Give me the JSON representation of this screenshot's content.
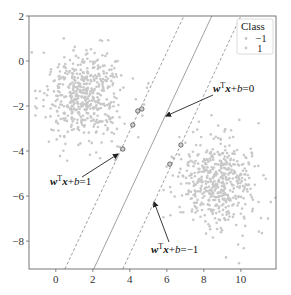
{
  "chart_data": {
    "type": "scatter",
    "title": "",
    "xlabel": "",
    "ylabel": "",
    "xlim": [
      -1.45,
      11.9
    ],
    "ylim": [
      -9.24,
      2
    ],
    "grid": false,
    "x_ticks": [
      0,
      2,
      4,
      6,
      8,
      10
    ],
    "x_tick_labels": [
      "0",
      "2",
      "4",
      "6",
      "8",
      "10"
    ],
    "y_ticks": [
      2,
      0,
      -2,
      -4,
      -6,
      -8
    ],
    "y_tick_labels": [
      "2",
      "0",
      "−2",
      "−4",
      "−6",
      "−8"
    ],
    "legend": {
      "title": "Class",
      "position": "upper right",
      "entries": [
        {
          "label": "−1",
          "color": "#c8c8c8"
        },
        {
          "label": "1",
          "color": "#c8c8c8"
        }
      ]
    },
    "series": [
      {
        "name": "−1",
        "color": "#c8c8c8",
        "center": [
          1.55,
          -1.55
        ],
        "std": [
          1.05,
          1.0
        ],
        "count": 500,
        "seed": 7
      },
      {
        "name": "1",
        "color": "#c8c8c8",
        "center": [
          8.8,
          -5.3
        ],
        "std": [
          1.0,
          1.05
        ],
        "count": 500,
        "seed": 13
      }
    ],
    "support_vectors": [
      [
        3.62,
        -3.91
      ],
      [
        4.16,
        -2.84
      ],
      [
        4.43,
        -2.22
      ],
      [
        4.65,
        -2.13
      ],
      [
        6.16,
        -4.58
      ],
      [
        6.76,
        -3.73
      ]
    ],
    "lines": [
      {
        "name": "w^T x + b = 1",
        "style": "dashed",
        "p1": [
          0.49,
          -9.24
        ],
        "p2": [
          6.92,
          2
        ]
      },
      {
        "name": "w^T x + b = 0",
        "style": "solid",
        "p1": [
          2.05,
          -9.24
        ],
        "p2": [
          8.43,
          2
        ]
      },
      {
        "name": "w^T x + b = -1",
        "style": "dashed",
        "p1": [
          3.62,
          -9.24
        ],
        "p2": [
          10.0,
          2
        ]
      }
    ],
    "annotations": [
      {
        "text_bold": "w",
        "sup": "T",
        "text_bold2": "x",
        "rest_pre": "+",
        "italic": "b",
        "rest": "=0",
        "text_xy": [
          213,
          92
        ],
        "arrow_from": [
          213,
          95
        ],
        "arrow_to": [
          166,
          116
        ]
      },
      {
        "text_bold": "w",
        "sup": "T",
        "text_bold2": "x",
        "rest_pre": "+",
        "italic": "b",
        "rest": "=1",
        "text_xy": [
          50,
          185
        ],
        "arrow_from": [
          82,
          177
        ],
        "arrow_to": [
          118,
          154
        ]
      },
      {
        "text_bold": "w",
        "sup": "T",
        "text_bold2": "x",
        "rest_pre": "+",
        "italic": "b",
        "rest": "=−1",
        "text_xy": [
          151,
          253
        ],
        "arrow_from": [
          169,
          242
        ],
        "arrow_to": [
          154,
          202
        ]
      }
    ]
  }
}
